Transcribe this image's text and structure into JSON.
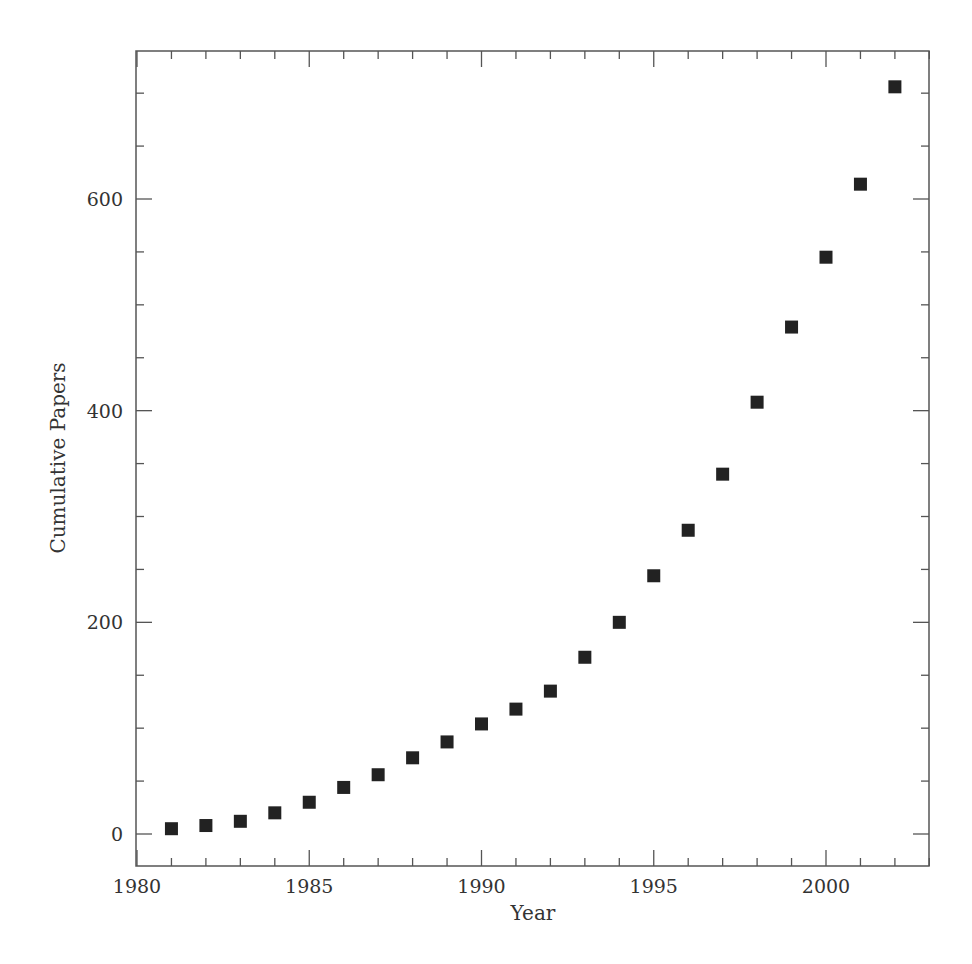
{
  "chart_data": {
    "type": "scatter",
    "title": "",
    "xlabel": "Year",
    "ylabel": "Cumulative Papers",
    "xlim": [
      1980,
      2003
    ],
    "ylim": [
      -30,
      740
    ],
    "x_major_ticks": [
      1980,
      1985,
      1990,
      1995,
      2000
    ],
    "x_minor_step": 1,
    "y_major_ticks": [
      0,
      200,
      400,
      600
    ],
    "y_minor_step": 50,
    "grid": false,
    "legend": null,
    "marker": "filled-square",
    "marker_color": "#222222",
    "series": [
      {
        "name": "Cumulative Papers",
        "x": [
          1981,
          1982,
          1983,
          1984,
          1985,
          1986,
          1987,
          1988,
          1989,
          1990,
          1991,
          1992,
          1993,
          1994,
          1995,
          1996,
          1997,
          1998,
          1999,
          2000,
          2001,
          2002
        ],
        "values": [
          5,
          8,
          12,
          20,
          30,
          44,
          56,
          72,
          87,
          104,
          118,
          135,
          167,
          200,
          244,
          287,
          340,
          408,
          479,
          545,
          614,
          706
        ]
      }
    ]
  },
  "colors": {
    "axis": "#555555",
    "text": "#333333",
    "marker": "#222222",
    "background": "#ffffff"
  }
}
